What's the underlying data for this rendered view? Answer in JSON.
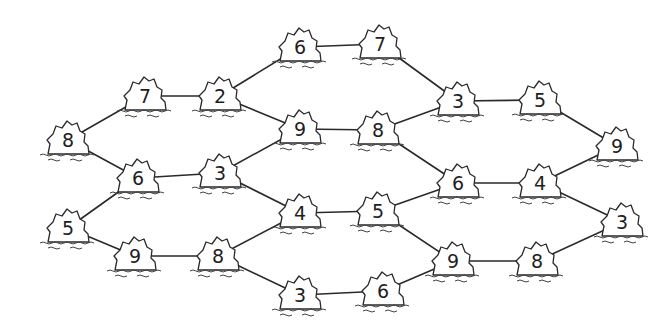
{
  "diagram": {
    "type": "island-bridge-puzzle",
    "colors": {
      "line": "#2a2a2a",
      "background": "#ffffff"
    },
    "islands": [
      {
        "id": "i1",
        "value": "6",
        "x": 300,
        "y": 47
      },
      {
        "id": "i2",
        "value": "7",
        "x": 380,
        "y": 44
      },
      {
        "id": "i3",
        "value": "7",
        "x": 145,
        "y": 96
      },
      {
        "id": "i4",
        "value": "2",
        "x": 220,
        "y": 96
      },
      {
        "id": "i5",
        "value": "3",
        "x": 458,
        "y": 101
      },
      {
        "id": "i6",
        "value": "5",
        "x": 540,
        "y": 100
      },
      {
        "id": "i7",
        "value": "8",
        "x": 68,
        "y": 140
      },
      {
        "id": "i8",
        "value": "9",
        "x": 300,
        "y": 129
      },
      {
        "id": "i9",
        "value": "8",
        "x": 378,
        "y": 130
      },
      {
        "id": "i10",
        "value": "9",
        "x": 617,
        "y": 146
      },
      {
        "id": "i11",
        "value": "6",
        "x": 138,
        "y": 178
      },
      {
        "id": "i12",
        "value": "3",
        "x": 220,
        "y": 173
      },
      {
        "id": "i13",
        "value": "6",
        "x": 458,
        "y": 183
      },
      {
        "id": "i14",
        "value": "4",
        "x": 540,
        "y": 183
      },
      {
        "id": "i15",
        "value": "4",
        "x": 300,
        "y": 213
      },
      {
        "id": "i16",
        "value": "5",
        "x": 378,
        "y": 211
      },
      {
        "id": "i17",
        "value": "5",
        "x": 68,
        "y": 228
      },
      {
        "id": "i18",
        "value": "3",
        "x": 622,
        "y": 222
      },
      {
        "id": "i19",
        "value": "9",
        "x": 135,
        "y": 256
      },
      {
        "id": "i20",
        "value": "8",
        "x": 218,
        "y": 256
      },
      {
        "id": "i21",
        "value": "9",
        "x": 453,
        "y": 261
      },
      {
        "id": "i22",
        "value": "8",
        "x": 537,
        "y": 261
      },
      {
        "id": "i23",
        "value": "3",
        "x": 300,
        "y": 295
      },
      {
        "id": "i24",
        "value": "6",
        "x": 383,
        "y": 291
      }
    ],
    "bridges": [
      [
        "i1",
        "i2"
      ],
      [
        "i1",
        "i4"
      ],
      [
        "i2",
        "i5"
      ],
      [
        "i3",
        "i4"
      ],
      [
        "i3",
        "i7"
      ],
      [
        "i4",
        "i8"
      ],
      [
        "i5",
        "i6"
      ],
      [
        "i5",
        "i9"
      ],
      [
        "i6",
        "i10"
      ],
      [
        "i8",
        "i9"
      ],
      [
        "i8",
        "i12"
      ],
      [
        "i9",
        "i13"
      ],
      [
        "i7",
        "i11"
      ],
      [
        "i11",
        "i12"
      ],
      [
        "i12",
        "i15"
      ],
      [
        "i10",
        "i14"
      ],
      [
        "i13",
        "i14"
      ],
      [
        "i13",
        "i16"
      ],
      [
        "i15",
        "i16"
      ],
      [
        "i15",
        "i20"
      ],
      [
        "i16",
        "i21"
      ],
      [
        "i11",
        "i17"
      ],
      [
        "i17",
        "i19"
      ],
      [
        "i19",
        "i20"
      ],
      [
        "i14",
        "i18"
      ],
      [
        "i18",
        "i22"
      ],
      [
        "i21",
        "i22"
      ],
      [
        "i20",
        "i23"
      ],
      [
        "i23",
        "i24"
      ],
      [
        "i24",
        "i21"
      ]
    ]
  }
}
